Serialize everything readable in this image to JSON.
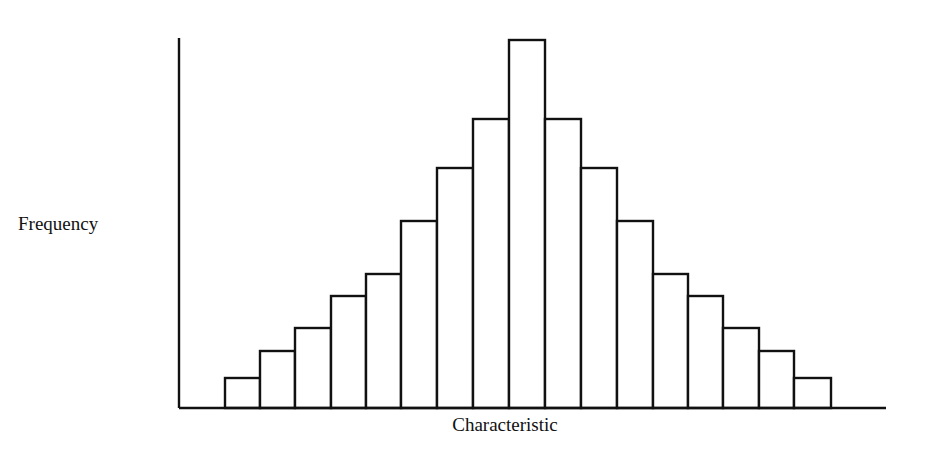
{
  "chart_data": {
    "type": "bar",
    "title": "",
    "xlabel": "Characteristic",
    "ylabel": "Frequency",
    "categories": [
      "1",
      "2",
      "3",
      "4",
      "5",
      "6",
      "7",
      "8",
      "9",
      "10",
      "11",
      "12",
      "13",
      "14",
      "15",
      "16",
      "17"
    ],
    "values": [
      1.0,
      2.0,
      2.8,
      4.0,
      4.8,
      6.6,
      8.6,
      10.4,
      13.3,
      10.4,
      8.6,
      6.6,
      4.8,
      4.0,
      2.8,
      2.0,
      1.0
    ],
    "bar_edges_px": [
      225,
      260,
      295,
      331,
      366,
      401,
      437,
      473,
      509,
      545,
      581,
      617,
      653,
      688,
      723,
      759,
      794,
      831
    ],
    "bar_tops_px": [
      378,
      351,
      328,
      296,
      274,
      221,
      168,
      119,
      40,
      119,
      168,
      221,
      274,
      296,
      328,
      351,
      378
    ],
    "ticks": "none",
    "grid": false,
    "legend": "none",
    "shape": "symmetric bell-shaped histogram"
  },
  "axes": {
    "origin_x": 179,
    "baseline_y": 408,
    "y_top": 38,
    "x_end": 886
  },
  "labels": {
    "y": "Frequency",
    "x": "Characteristic"
  }
}
